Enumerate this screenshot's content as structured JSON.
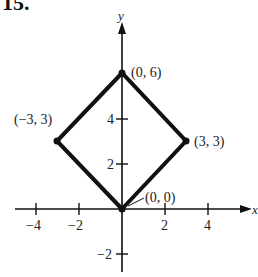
{
  "problem_number": "15.",
  "axes": {
    "x_label": "x",
    "y_label": "y",
    "x_ticks": [
      {
        "value": -4,
        "label": "−4"
      },
      {
        "value": -2,
        "label": "−2"
      },
      {
        "value": 2,
        "label": "2"
      },
      {
        "value": 4,
        "label": "4"
      }
    ],
    "y_ticks": [
      {
        "value": -2,
        "label": "−2"
      },
      {
        "value": 2,
        "label": "2"
      },
      {
        "value": 4,
        "label": "4"
      }
    ]
  },
  "shape": {
    "type": "square (rotated 45°)",
    "vertices": [
      {
        "x": 0,
        "y": 0,
        "label": "(0,  0)"
      },
      {
        "x": 3,
        "y": 3,
        "label": "(3,  3)"
      },
      {
        "x": 0,
        "y": 6,
        "label": "(0,  6)"
      },
      {
        "x": -3,
        "y": 3,
        "label": "(−3,  3)"
      }
    ]
  },
  "colors": {
    "line": "#111111",
    "text": "#222222",
    "background": "#ffffff"
  }
}
